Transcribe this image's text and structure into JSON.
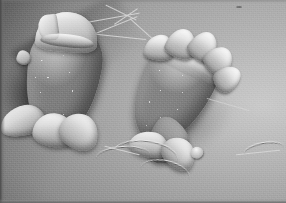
{
  "image": {
    "kind": "scanning-electron-micrograph",
    "subject": "Two flagellated protozoan cells (Trichomonas-like parasites)",
    "color_mode": "grayscale",
    "width_px": 286,
    "height_px": 203,
    "visible_text": "",
    "palette": {
      "background_light": "#c9c9c9",
      "background_mid": "#9a9a9a",
      "background_dark": "#6f6f6f",
      "substrate_shadow": "#2b2b2b",
      "cell_body_mid": "#9b9b9b",
      "cell_body_shadow": "#6a6a6a",
      "membrane_highlight": "#fafafa",
      "border_edge": "#555555"
    }
  },
  "scene": {
    "background_label": "granular substrate surface",
    "specimens": [
      {
        "id": "cell-left",
        "label": "left protozoan cell",
        "orientation": "anterior up-left, posterior down-right",
        "features": [
          "anterior hood / apical cap",
          "granular cell surface with bright speckles",
          "lateral tab projection",
          "posterior ruffled membrane folds",
          "trailing flagellum"
        ]
      },
      {
        "id": "cell-right",
        "label": "right protozoan cell",
        "orientation": "tilted, anterior upper-left, posterior lower-right",
        "features": [
          "wavy undulating membrane with five crests",
          "granular cell surface with bright speckles",
          "tapered posterior tail",
          "curled posterior membrane",
          "flagellar knob at tail tip"
        ]
      }
    ],
    "flagella": [
      {
        "id": "flagellum-upper-1",
        "label": "anterior flagellum arcing upper-left"
      },
      {
        "id": "flagellum-upper-2",
        "label": "anterior flagellum arcing upper-centre"
      },
      {
        "id": "flagellum-upper-3",
        "label": "branching anterior flagellum"
      },
      {
        "id": "flagellum-lower-1",
        "label": "trailing posterior flagellum of left cell"
      },
      {
        "id": "flagellum-lower-2",
        "label": "long posterior flagellum extending lower-right"
      },
      {
        "id": "flagellum-right-tail",
        "label": "posterior flagellum of right cell"
      }
    ]
  }
}
